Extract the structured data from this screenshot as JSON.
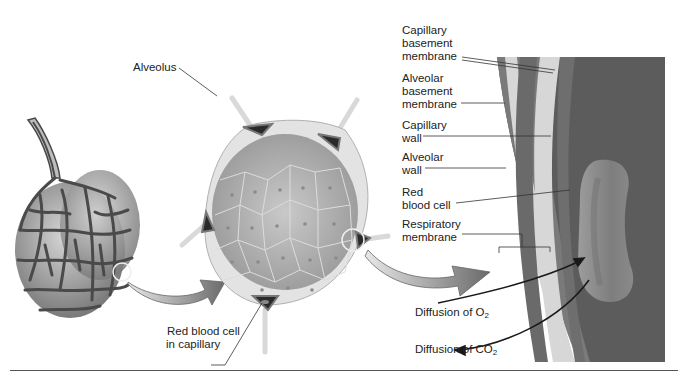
{
  "diagram": {
    "type": "respiratory-membrane-illustration",
    "colors": {
      "background": "#ffffff",
      "capillary_network": "#4a4a4a",
      "alveolar_sac": "#a8a8a8",
      "alveolus_interior": "#b9b9b9",
      "alveolus_wall": "#e2e2e2",
      "capillary_lumen": "#6e6e6e",
      "panel_dark": "#5c5c5c",
      "membrane_light": "#d8d8d8",
      "red_blood_cell": "#8f8f8f",
      "arrow": "#1a1a1a",
      "big_arrow": "#8a8a8a"
    },
    "labels": {
      "alveolus": "Alveolus",
      "rbc_in_capillary_line1": "Red blood cell",
      "rbc_in_capillary_line2": "in capillary",
      "capillary_basement_membrane": "Capillary\nbasement\nmembrane",
      "alveolar_basement_membrane": "Alveolar\nbasement\nmembrane",
      "capillary_wall": "Capillary\nwall",
      "alveolar_wall": "Alveolar\nwall",
      "red_blood_cell": "Red\nblood cell",
      "respiratory_membrane": "Respiratory\nmembrane",
      "diffusion_o2_prefix": "Diffusion of O",
      "diffusion_o2_sub": "2",
      "diffusion_co2_prefix": "Diffusion of CO",
      "diffusion_co2_sub": "2"
    }
  }
}
